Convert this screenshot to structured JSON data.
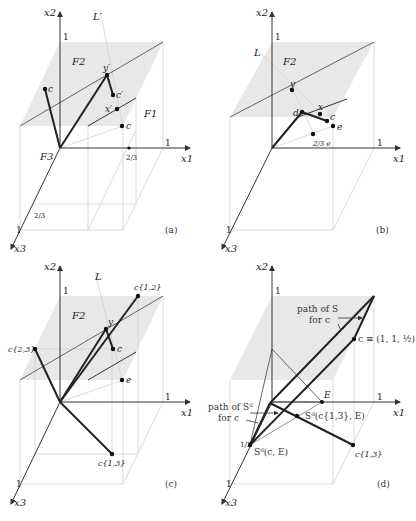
{
  "figure": {
    "panels": [
      {
        "id": "a",
        "caption": "(a)",
        "axes": {
          "x1": "x1",
          "x2": "x2",
          "x3": "x3"
        },
        "ticks": {
          "x2_one": "1",
          "x1_one": "1",
          "x1_two_thirds": "2/3",
          "x3_two_thirds": "2/3",
          "x3_one": "1"
        },
        "faces": {
          "F1": "F1",
          "F2": "F2",
          "F3": "F3"
        },
        "line_label": "L′",
        "points": {
          "c_top": "c",
          "y_prime": "y′",
          "c_prime": "c′",
          "x_prime": "x′",
          "c_bottom": "c"
        }
      },
      {
        "id": "b",
        "caption": "(b)",
        "axes": {
          "x1": "x1",
          "x2": "x2",
          "x3": "x3"
        },
        "ticks": {
          "x2_one": "1",
          "x1_one": "1",
          "x3_one": "1"
        },
        "faces": {
          "F2": "F2"
        },
        "line_label": "L",
        "points": {
          "y": "y",
          "d": "d",
          "x": "x",
          "c": "c",
          "e": "e",
          "two_thirds_e": "2/3 e"
        }
      },
      {
        "id": "c",
        "caption": "(c)",
        "axes": {
          "x1": "x1",
          "x2": "x2",
          "x3": "x3"
        },
        "ticks": {
          "x2_one": "1",
          "x1_one": "1",
          "x3_one": "1"
        },
        "faces": {
          "F2": "F2"
        },
        "line_label": "L",
        "points": {
          "c12": "c{1,2}",
          "c23": "c{2,3}",
          "c13": "c{1,3}",
          "y": "y",
          "c": "c",
          "e": "e"
        }
      },
      {
        "id": "d",
        "caption": "(d)",
        "axes": {
          "x1": "x1",
          "x2": "x2",
          "x3": "x3"
        },
        "ticks": {
          "x2_one": "1",
          "x1_one": "1",
          "x3_half": "1/2",
          "x3_one": "1"
        },
        "annotations": {
          "path_S": "path of S",
          "path_S_for": "for c",
          "c_equiv": "c ≡ (1, 1, ½)",
          "E": "E",
          "path_Sd": "path of Sᵈ",
          "path_Sd_for": "for c",
          "Sd_c13_E": "Sᵈ(c{1,3}, E)",
          "Sd_c_E": "Sᵈ(c, E)",
          "c13": "c{1,3}"
        }
      }
    ],
    "colors": {
      "face_fill": "#e6e6e6",
      "thin_line": "#cfcfcf",
      "axis": "#333333",
      "bold_line": "#222222"
    }
  }
}
